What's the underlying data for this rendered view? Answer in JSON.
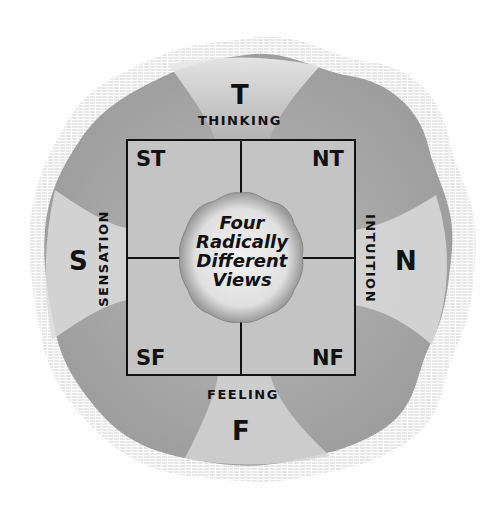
{
  "diagram": {
    "poles": {
      "top": "T",
      "bottom": "F",
      "left": "S",
      "right": "N"
    },
    "axis_labels": {
      "top": "THINKING",
      "bottom": "FEELING",
      "left": "SENSATION",
      "right": "INTUITION"
    },
    "quadrants": {
      "top_left": "ST",
      "top_right": "NT",
      "bottom_left": "SF",
      "bottom_right": "NF"
    },
    "center": {
      "lines": [
        "Four",
        "Radically",
        "Different",
        "Views"
      ]
    },
    "colors": {
      "blob_fill": "#a9a9a9",
      "square_fill": "#c4c4c4",
      "center_fill": "#e6e6e6",
      "lines": "#111111",
      "hatch": "#c8c8c8"
    }
  }
}
